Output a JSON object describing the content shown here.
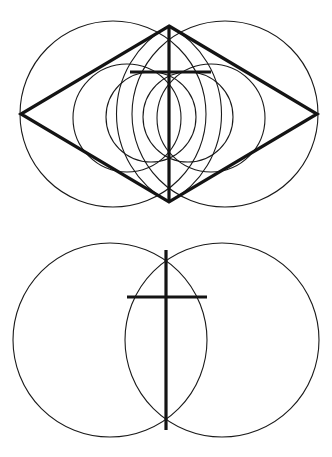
{
  "page": {
    "background_color": "#ffffff",
    "stroke_color": "#1a1a1a",
    "bold_stroke_color": "#141414",
    "width": 332,
    "height": 457
  },
  "chart_data": {
    "type": "diagram",
    "coordinate_system": "pixels, origin top-left, 332x457",
    "figures": [
      {
        "name": "upper-figure",
        "label": "Vesica with rhombus, medium circles and cross",
        "vertical_axis_x": 169,
        "elements": [
          {
            "id": "upper-large-circle-left",
            "kind": "circle",
            "cx": 113,
            "cy": 114,
            "r": 93,
            "weight": "thin"
          },
          {
            "id": "upper-large-circle-right",
            "kind": "circle",
            "cx": 225,
            "cy": 114,
            "r": 93,
            "weight": "thin"
          },
          {
            "id": "upper-medium-circle-left",
            "kind": "circle",
            "cx": 127,
            "cy": 118,
            "r": 54,
            "weight": "thin"
          },
          {
            "id": "upper-medium-circle-right",
            "kind": "circle",
            "cx": 211,
            "cy": 118,
            "r": 54,
            "weight": "thin"
          },
          {
            "id": "upper-inner-circle-left",
            "kind": "circle",
            "cx": 151,
            "cy": 117,
            "r": 45,
            "weight": "thin"
          },
          {
            "id": "upper-inner-circle-right",
            "kind": "circle",
            "cx": 188,
            "cy": 117,
            "r": 45,
            "weight": "thin"
          },
          {
            "id": "upper-vesica-arc-left",
            "kind": "arc",
            "description": "tall vesica arc from top apex to bottom apex, bulging left",
            "from": [
              169,
              26
            ],
            "to": [
              169,
              202
            ],
            "radius": 100,
            "sweep": 0,
            "weight": "thin"
          },
          {
            "id": "upper-vesica-arc-right",
            "kind": "arc",
            "description": "tall vesica arc from top apex to bottom apex, bulging right",
            "from": [
              169,
              26
            ],
            "to": [
              169,
              202
            ],
            "radius": 100,
            "sweep": 1,
            "weight": "thin"
          },
          {
            "id": "upper-rhombus",
            "kind": "polygon",
            "description": "rhombus / double triangle joining four apexes",
            "points": [
              [
                169,
                26
              ],
              [
                317,
                114
              ],
              [
                169,
                202
              ],
              [
                21,
                114
              ]
            ],
            "weight": "bold"
          },
          {
            "id": "upper-cross-vertical",
            "kind": "line",
            "from": [
              169,
              26
            ],
            "to": [
              169,
              202
            ],
            "weight": "bold"
          },
          {
            "id": "upper-cross-horizontal",
            "kind": "line",
            "from": [
              130,
              72
            ],
            "to": [
              211,
              72
            ],
            "weight": "bold"
          }
        ]
      },
      {
        "name": "lower-figure",
        "label": "Vesica piscis with inscribed cross",
        "vertical_axis_x": 166,
        "elements": [
          {
            "id": "lower-circle-left",
            "kind": "circle",
            "cx": 110,
            "cy": 340,
            "r": 97,
            "weight": "thin"
          },
          {
            "id": "lower-circle-right",
            "kind": "circle",
            "cx": 222,
            "cy": 340,
            "r": 97,
            "weight": "thin"
          },
          {
            "id": "lower-cross-vertical",
            "kind": "line",
            "from": [
              166,
              250
            ],
            "to": [
              166,
              430
            ],
            "weight": "bold"
          },
          {
            "id": "lower-cross-horizontal",
            "kind": "line",
            "from": [
              127,
              297
            ],
            "to": [
              207,
              297
            ],
            "weight": "bold"
          }
        ]
      }
    ]
  }
}
